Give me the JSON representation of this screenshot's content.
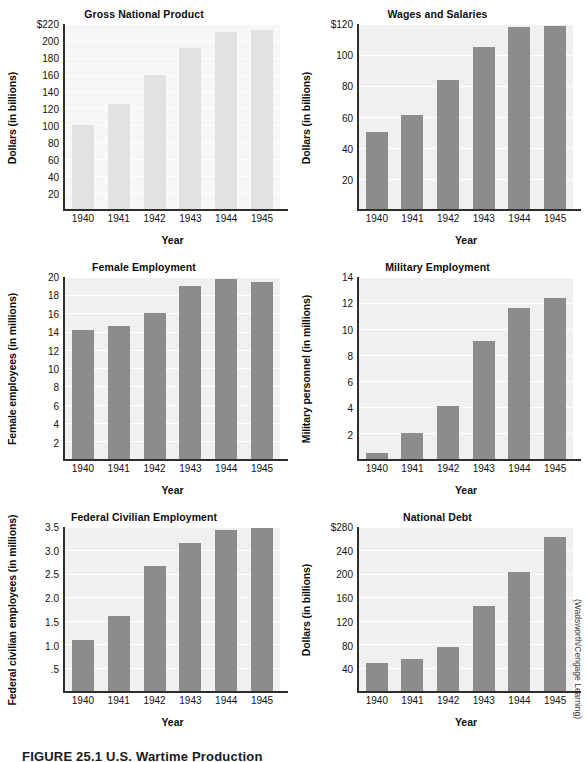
{
  "figure": {
    "caption": "FIGURE 25.1 U.S. Wartime Production",
    "credit": "(Wadsworth/Cengage Learning)",
    "bar_color": "#8c8c8c",
    "plot_bg": "#f0f0f0",
    "gridline_color": "#ffffff",
    "axis_color": "#2e2e2e"
  },
  "chart_data": [
    {
      "id": "gross-national-product",
      "type": "bar",
      "title": "Gross National Product",
      "xlabel": "Year",
      "ylabel": "Dollars (in billions)",
      "categories": [
        "1940",
        "1941",
        "1942",
        "1943",
        "1944",
        "1945"
      ],
      "values": [
        100,
        125,
        159,
        192,
        211,
        213
      ],
      "yticks": [
        "$220",
        "200",
        "180",
        "160",
        "140",
        "120",
        "100",
        "80",
        "60",
        "40",
        "20"
      ],
      "ytick_values": [
        220,
        200,
        180,
        160,
        140,
        120,
        100,
        80,
        60,
        40,
        20
      ],
      "ylim": [
        0,
        220
      ],
      "grid": true,
      "legend": "none",
      "faded": true
    },
    {
      "id": "wages-and-salaries",
      "type": "bar",
      "title": "Wages and Salaries",
      "xlabel": "Year",
      "ylabel": "Dollars (in billions)",
      "categories": [
        "1940",
        "1941",
        "1942",
        "1943",
        "1944",
        "1945"
      ],
      "values": [
        50,
        61,
        84,
        105,
        118,
        119
      ],
      "yticks": [
        "$120",
        "100",
        "80",
        "60",
        "40",
        "20"
      ],
      "ytick_values": [
        120,
        100,
        80,
        60,
        40,
        20
      ],
      "ylim": [
        0,
        120
      ],
      "grid": true,
      "legend": "none",
      "faded": false
    },
    {
      "id": "female-employment",
      "type": "bar",
      "title": "Female Employment",
      "xlabel": "Year",
      "ylabel": "Female employees (in millions)",
      "categories": [
        "1940",
        "1941",
        "1942",
        "1943",
        "1944",
        "1945"
      ],
      "values": [
        14.2,
        14.6,
        16.1,
        19.0,
        19.8,
        19.4
      ],
      "yticks": [
        "20",
        "18",
        "16",
        "14",
        "12",
        "10",
        "8",
        "6",
        "4",
        "2"
      ],
      "ytick_values": [
        20,
        18,
        16,
        14,
        12,
        10,
        8,
        6,
        4,
        2
      ],
      "ylim": [
        0,
        20
      ],
      "grid": true,
      "legend": "none",
      "faded": false
    },
    {
      "id": "military-employment",
      "type": "bar",
      "title": "Military Employment",
      "xlabel": "Year",
      "ylabel": "Military personnel (in millions)",
      "categories": [
        "1940",
        "1941",
        "1942",
        "1943",
        "1944",
        "1945"
      ],
      "values": [
        0.5,
        2.0,
        4.1,
        9.1,
        11.6,
        12.4
      ],
      "yticks": [
        "14",
        "12",
        "10",
        "8",
        "6",
        "4",
        "2"
      ],
      "ytick_values": [
        14,
        12,
        10,
        8,
        6,
        4,
        2
      ],
      "ylim": [
        0,
        14
      ],
      "grid": true,
      "legend": "none",
      "faded": false
    },
    {
      "id": "federal-civilian-employment",
      "type": "bar",
      "title": "Federal Civilian Employment",
      "xlabel": "Year",
      "ylabel": "Federal civilian employees (in millions)",
      "categories": [
        "1940",
        "1941",
        "1942",
        "1943",
        "1944",
        "1945"
      ],
      "values": [
        1.1,
        1.6,
        2.66,
        3.17,
        3.43,
        3.47
      ],
      "yticks": [
        "3.5",
        "3.0",
        "2.5",
        "2.0",
        "1.5",
        "1.0",
        ".5"
      ],
      "ytick_values": [
        3.5,
        3.0,
        2.5,
        2.0,
        1.5,
        1.0,
        0.5
      ],
      "ylim": [
        0,
        3.5
      ],
      "grid": true,
      "legend": "none",
      "faded": false
    },
    {
      "id": "national-debt",
      "type": "bar",
      "title": "National Debt",
      "xlabel": "Year",
      "ylabel": "Dollars (in billions)",
      "categories": [
        "1940",
        "1941",
        "1942",
        "1943",
        "1944",
        "1945"
      ],
      "values": [
        48,
        56,
        76,
        145,
        203,
        263
      ],
      "yticks": [
        "$280",
        "240",
        "200",
        "160",
        "120",
        "80",
        "40"
      ],
      "ytick_values": [
        280,
        240,
        200,
        160,
        120,
        80,
        40
      ],
      "ylim": [
        0,
        280
      ],
      "grid": true,
      "legend": "none",
      "faded": false
    }
  ]
}
